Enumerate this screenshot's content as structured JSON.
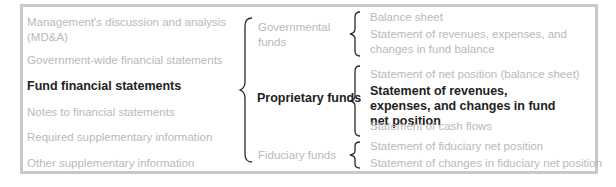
{
  "colors": {
    "muted_text": "#b9b9b9",
    "active_text": "#222222",
    "frame_border": "#c9c9c9",
    "bracket": "#2a2a2a"
  },
  "left_column": {
    "items": [
      {
        "label": "Management's discussion and analysis (MD&A)",
        "active": false
      },
      {
        "label": "Government-wide financial statements",
        "active": false
      },
      {
        "label": "Fund financial statements",
        "active": true
      },
      {
        "label": "Notes to financial statements",
        "active": false
      },
      {
        "label": "Required supplementary information",
        "active": false
      },
      {
        "label": "Other supplementary information",
        "active": false
      }
    ]
  },
  "middle_column": {
    "bracket_icon": "left-curly-brace",
    "items": [
      {
        "label": "Governmental funds",
        "active": false
      },
      {
        "label": "Proprietary funds",
        "active": true
      },
      {
        "label": "Fiduciary funds",
        "active": false
      }
    ]
  },
  "right_column": {
    "groups": [
      {
        "fund": "Governmental funds",
        "statements": [
          {
            "label": "Balance sheet",
            "active": false
          },
          {
            "label": "Statement of revenues, expenses, and changes in fund balance",
            "active": false
          }
        ]
      },
      {
        "fund": "Proprietary funds",
        "statements": [
          {
            "label": "Statement of net position (balance sheet)",
            "active": false
          },
          {
            "label": "Statement of revenues, expenses, and changes in fund net position",
            "active": true
          },
          {
            "label": "Statement of cash flows",
            "active": false
          }
        ]
      },
      {
        "fund": "Fiduciary funds",
        "statements": [
          {
            "label": "Statement of fiduciary net position",
            "active": false
          },
          {
            "label": "Statement of changes in fiduciary net position",
            "active": false
          }
        ]
      }
    ]
  }
}
